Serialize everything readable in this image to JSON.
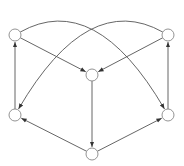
{
  "diagram": {
    "type": "directed-graph",
    "colors": {
      "edge": "#555555",
      "node_stroke": "#888888",
      "node_fill": "#ffffff",
      "background": "#ffffff"
    },
    "node_radius": 6,
    "nodes": [
      {
        "id": "top-left",
        "x": 15,
        "y": 35
      },
      {
        "id": "top-right",
        "x": 168,
        "y": 35
      },
      {
        "id": "center",
        "x": 92,
        "y": 75
      },
      {
        "id": "bottom-left",
        "x": 15,
        "y": 115
      },
      {
        "id": "bottom-right",
        "x": 168,
        "y": 115
      },
      {
        "id": "bottom",
        "x": 92,
        "y": 154
      }
    ],
    "edges": [
      {
        "from": "top-left",
        "to": "center",
        "curve": false
      },
      {
        "from": "top-right",
        "to": "center",
        "curve": false
      },
      {
        "from": "center",
        "to": "bottom",
        "curve": false
      },
      {
        "from": "bottom",
        "to": "bottom-left",
        "curve": false
      },
      {
        "from": "bottom",
        "to": "bottom-right",
        "curve": false
      },
      {
        "from": "bottom-left",
        "to": "top-left",
        "curve": false
      },
      {
        "from": "bottom-right",
        "to": "top-right",
        "curve": false
      },
      {
        "from": "top-left",
        "to": "bottom-right",
        "curve": true,
        "ctrl": [
          95,
          -10
        ]
      },
      {
        "from": "top-right",
        "to": "bottom-left",
        "curve": true,
        "ctrl": [
          88,
          -10
        ]
      }
    ]
  }
}
